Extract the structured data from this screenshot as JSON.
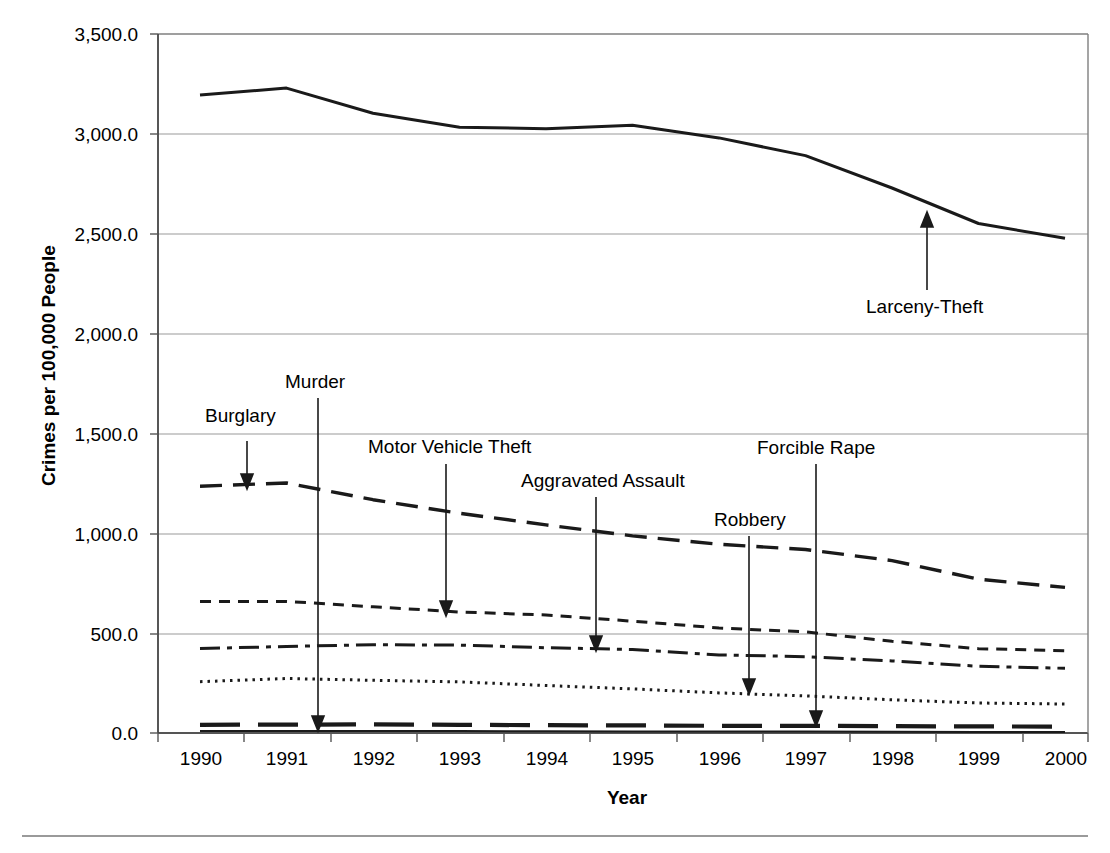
{
  "axes": {
    "ylabel": "Crimes per 100,000 People",
    "xlabel": "Year",
    "yticks": [
      "0.0",
      "500.0",
      "1,000.0",
      "1,500.0",
      "2,000.0",
      "2,500.0",
      "3,000.0",
      "3,500.0"
    ],
    "xticks": [
      "1990",
      "1991",
      "1992",
      "1993",
      "1994",
      "1995",
      "1996",
      "1997",
      "1998",
      "1999",
      "2000"
    ]
  },
  "annotations": [
    {
      "label": "Burglary",
      "series": "Burglary"
    },
    {
      "label": "Murder",
      "series": "Murder"
    },
    {
      "label": "Motor Vehicle Theft",
      "series": "Motor Vehicle Theft"
    },
    {
      "label": "Aggravated Assault",
      "series": "Aggravated Assault"
    },
    {
      "label": "Robbery",
      "series": "Robbery"
    },
    {
      "label": "Forcible Rape",
      "series": "Forcible Rape"
    },
    {
      "label": "Larceny-Theft",
      "series": "Larceny-Theft"
    }
  ],
  "chart_data": {
    "type": "line",
    "title": "",
    "xlabel": "Year",
    "ylabel": "Crimes per 100,000 People",
    "x": [
      1990,
      1991,
      1992,
      1993,
      1994,
      1995,
      1996,
      1997,
      1998,
      1999,
      2000
    ],
    "xlim": [
      1990,
      2000
    ],
    "ylim": [
      0,
      3500
    ],
    "ygrid": true,
    "legend": "none (inline arrow annotations)",
    "series": [
      {
        "name": "Larceny-Theft",
        "style": "solid",
        "values": [
          3195,
          3229,
          3103,
          3033,
          3026,
          3043,
          2980,
          2891,
          2729,
          2551,
          2477
        ]
      },
      {
        "name": "Burglary",
        "style": "long-dash",
        "values": [
          1236,
          1252,
          1168,
          1100,
          1042,
          987,
          945,
          919,
          863,
          770,
          729
        ]
      },
      {
        "name": "Motor Vehicle Theft",
        "style": "short-dash",
        "values": [
          658,
          659,
          632,
          606,
          591,
          560,
          526,
          506,
          459,
          422,
          412
        ]
      },
      {
        "name": "Aggravated Assault",
        "style": "dash-dot",
        "values": [
          423,
          433,
          442,
          440,
          427,
          418,
          391,
          382,
          361,
          334,
          324
        ]
      },
      {
        "name": "Robbery",
        "style": "dotted",
        "values": [
          257,
          273,
          264,
          256,
          238,
          221,
          201,
          186,
          166,
          150,
          145
        ]
      },
      {
        "name": "Forcible Rape",
        "style": "thick-dash",
        "values": [
          41,
          42,
          43,
          41,
          39,
          38,
          36,
          36,
          34,
          33,
          32
        ]
      },
      {
        "name": "Murder",
        "style": "thin-solid",
        "values": [
          9.4,
          9.8,
          9.3,
          9.5,
          9.0,
          8.2,
          7.4,
          6.8,
          6.3,
          5.7,
          5.5
        ]
      }
    ]
  }
}
